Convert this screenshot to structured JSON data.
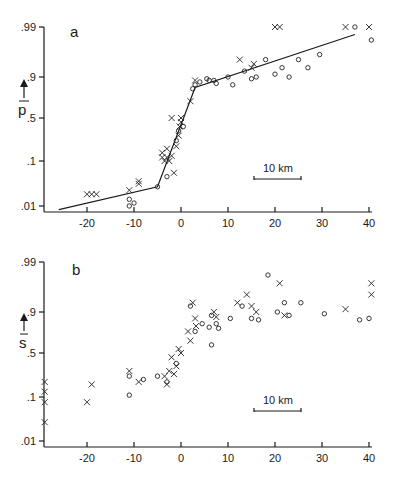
{
  "chart_data": [
    {
      "panel": "a",
      "type": "scatter",
      "ylabel": "p̄",
      "xlabel": "",
      "xticks": [
        -20,
        -10,
        0,
        10,
        20,
        30,
        40
      ],
      "yticks": [
        ".01",
        ".1",
        ".5",
        ".9",
        ".99"
      ],
      "xlim": [
        -29,
        41
      ],
      "scale_bar": "10 km",
      "fit_line": [
        [
          -26,
          0.008
        ],
        [
          -5,
          0.03
        ],
        [
          3,
          0.83
        ],
        [
          37,
          0.985
        ]
      ],
      "series": [
        {
          "name": "x",
          "marker": "cross",
          "points": [
            [
              -20,
              0.02
            ],
            [
              -19,
              0.02
            ],
            [
              -18,
              0.02
            ],
            [
              -11,
              0.025
            ],
            [
              -9,
              0.035
            ],
            [
              -9,
              0.04
            ],
            [
              -4,
              0.12
            ],
            [
              -4,
              0.15
            ],
            [
              -3.5,
              0.1
            ],
            [
              -3,
              0.12
            ],
            [
              -3,
              0.18
            ],
            [
              -2.5,
              0.1
            ],
            [
              -2,
              0.13
            ],
            [
              -2,
              0.5
            ],
            [
              -1.5,
              0.06
            ],
            [
              -1,
              0.2
            ],
            [
              -0.5,
              0.3
            ],
            [
              -0.3,
              0.4
            ],
            [
              0,
              0.45
            ],
            [
              0,
              0.5
            ],
            [
              2,
              0.7
            ],
            [
              3,
              0.88
            ],
            [
              12.5,
              0.95
            ],
            [
              15,
              0.93
            ],
            [
              15.5,
              0.94
            ],
            [
              20,
              0.99
            ],
            [
              21,
              0.99
            ],
            [
              35,
              0.99
            ],
            [
              40,
              0.99
            ]
          ]
        },
        {
          "name": "o",
          "marker": "circle",
          "points": [
            [
              -11,
              0.015
            ],
            [
              -11,
              0.01
            ],
            [
              -10,
              0.012
            ],
            [
              -5,
              0.03
            ],
            [
              -3,
              0.05
            ],
            [
              -1,
              0.25
            ],
            [
              -0.5,
              0.35
            ],
            [
              0.5,
              0.4
            ],
            [
              2.5,
              0.82
            ],
            [
              3,
              0.85
            ],
            [
              4,
              0.87
            ],
            [
              5.5,
              0.89
            ],
            [
              6,
              0.88
            ],
            [
              7,
              0.88
            ],
            [
              7.5,
              0.86
            ],
            [
              10,
              0.9
            ],
            [
              11,
              0.85
            ],
            [
              13.5,
              0.92
            ],
            [
              15,
              0.89
            ],
            [
              16,
              0.9
            ],
            [
              18,
              0.95
            ],
            [
              20,
              0.91
            ],
            [
              21.5,
              0.93
            ],
            [
              23,
              0.9
            ],
            [
              25,
              0.95
            ],
            [
              27,
              0.93
            ],
            [
              29.5,
              0.96
            ],
            [
              37,
              0.99
            ],
            [
              40.5,
              0.98
            ]
          ]
        }
      ]
    },
    {
      "panel": "b",
      "type": "scatter",
      "ylabel": "s̄",
      "xlabel": "",
      "xticks": [
        -20,
        -10,
        0,
        10,
        20,
        30,
        40
      ],
      "yticks": [
        ".01",
        ".1",
        ".5",
        ".9",
        ".99"
      ],
      "xlim": [
        -29,
        41
      ],
      "scale_bar": "10 km",
      "series": [
        {
          "name": "x",
          "marker": "cross",
          "points": [
            [
              -29,
              0.2
            ],
            [
              -29,
              0.13
            ],
            [
              -29,
              0.08
            ],
            [
              -29,
              0.03
            ],
            [
              -20,
              0.08
            ],
            [
              -19,
              0.18
            ],
            [
              -11,
              0.3
            ],
            [
              -9,
              0.2
            ],
            [
              -3.5,
              0.25
            ],
            [
              -3,
              0.18
            ],
            [
              -2.5,
              0.3
            ],
            [
              -2,
              0.45
            ],
            [
              -1.5,
              0.27
            ],
            [
              -1,
              0.35
            ],
            [
              -0.5,
              0.55
            ],
            [
              0,
              0.5
            ],
            [
              1.5,
              0.75
            ],
            [
              2,
              0.65
            ],
            [
              2.5,
              0.93
            ],
            [
              3,
              0.86
            ],
            [
              3.2,
              0.8
            ],
            [
              7,
              0.9
            ],
            [
              7.5,
              0.87
            ],
            [
              12,
              0.93
            ],
            [
              14,
              0.95
            ],
            [
              15,
              0.92
            ],
            [
              16,
              0.9
            ],
            [
              21,
              0.97
            ],
            [
              22,
              0.88
            ],
            [
              35,
              0.91
            ],
            [
              40.5,
              0.97
            ],
            [
              40.5,
              0.95
            ]
          ]
        },
        {
          "name": "o",
          "marker": "circle",
          "points": [
            [
              -11,
              0.25
            ],
            [
              -11,
              0.11
            ],
            [
              -8,
              0.22
            ],
            [
              -5,
              0.25
            ],
            [
              -3,
              0.2
            ],
            [
              -1,
              0.38
            ],
            [
              2,
              0.92
            ],
            [
              3,
              0.75
            ],
            [
              4.5,
              0.82
            ],
            [
              6,
              0.79
            ],
            [
              6.5,
              0.88
            ],
            [
              6.5,
              0.6
            ],
            [
              7.5,
              0.82
            ],
            [
              8,
              0.78
            ],
            [
              10.5,
              0.86
            ],
            [
              13,
              0.92
            ],
            [
              15,
              0.86
            ],
            [
              16.5,
              0.85
            ],
            [
              18.5,
              0.98
            ],
            [
              20.5,
              0.9
            ],
            [
              22,
              0.93
            ],
            [
              23,
              0.88
            ],
            [
              25.5,
              0.93
            ],
            [
              30.5,
              0.89
            ],
            [
              38,
              0.85
            ],
            [
              40,
              0.86
            ]
          ]
        }
      ]
    }
  ],
  "panels": {
    "a": {
      "label": "a",
      "ylabel": "p",
      "scale_bar_label": "10 km"
    },
    "b": {
      "label": "b",
      "ylabel": "s",
      "scale_bar_label": "10 km"
    }
  },
  "ticks": {
    "x": [
      "-20",
      "-10",
      "0",
      "10",
      "20",
      "30",
      "40"
    ],
    "y": [
      ".99",
      ".9",
      ".5",
      ".1",
      ".01"
    ]
  }
}
